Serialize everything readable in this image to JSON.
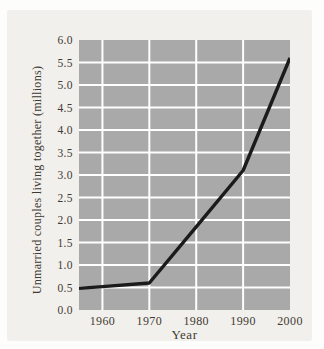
{
  "chart_data": {
    "type": "line",
    "title": "",
    "xlabel": "Year",
    "ylabel": "Unmarried couples living together (millions)",
    "xlim": [
      1955,
      2000
    ],
    "ylim": [
      0,
      6
    ],
    "x_ticks": [
      "1960",
      "1970",
      "1980",
      "1990",
      "2000"
    ],
    "y_ticks": [
      "6.0",
      "5.5",
      "5.0",
      "4.5",
      "4.0",
      "3.5",
      "3.0",
      "2.5",
      "2.0",
      "1.5",
      "1.0",
      "0.5",
      "0.0"
    ],
    "grid": true,
    "legend_position": "none",
    "plot_background": "#a9a9a9",
    "gridline_color": "#ffffff",
    "series": [
      {
        "name": "Unmarried couples living together",
        "color": "#1b1b1b",
        "points": [
          {
            "x": 1955,
            "y": 0.48
          },
          {
            "x": 1960,
            "y": 0.52
          },
          {
            "x": 1970,
            "y": 0.6
          },
          {
            "x": 1980,
            "y": 1.85
          },
          {
            "x": 1990,
            "y": 3.1
          },
          {
            "x": 2000,
            "y": 5.6
          }
        ]
      }
    ]
  },
  "colors": {
    "page_background": "#fdfdfc",
    "panel_background": "#f2f0ec",
    "text": "#3f3a33"
  }
}
